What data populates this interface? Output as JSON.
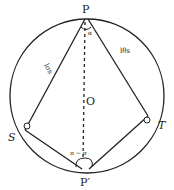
{
  "diagram": {
    "title": "",
    "points": {
      "P": "P",
      "P_prime": "P′",
      "O": "O",
      "S": "S",
      "T": "T"
    },
    "angles": {
      "at_P": "α",
      "at_P_prime": "π − σ"
    },
    "segment_labels": {
      "PS": "lσs",
      "PT": "lθs"
    },
    "colors": {
      "stroke": "#222222",
      "background": "#ffffff"
    }
  }
}
